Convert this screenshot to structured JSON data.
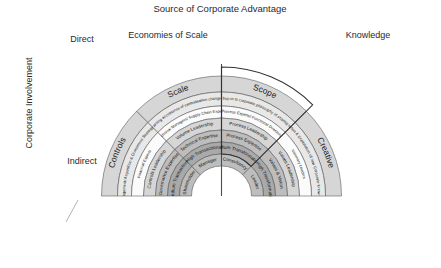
{
  "header": {
    "title": "Source of Corporate Advantage",
    "left_group": "Economies of Scale",
    "right_group": "Knowledge"
  },
  "vertical_axis": {
    "label": "Corporate Involvement",
    "top": "Direct",
    "bottom": "Indirect"
  },
  "chart_data": {
    "type": "diagram",
    "title": "Source of Corporate Advantage",
    "subtype": "concentric-arc-segments",
    "rings_outer_to_inner": [
      "configuration",
      "key_challenge",
      "people_type",
      "leadership_basis",
      "leadership_focus",
      "leadership_role",
      "centre_style"
    ],
    "sectors": [
      {
        "name": "Controls",
        "group": "Economies of Scale",
        "key_challenge": "Portfolio Management/ Acquisition & Divestment Strategy to Add Value",
        "people_type": "Financial Experts",
        "leadership_basis": "Controls Leadership",
        "leadership_focus": "Governance Expertise",
        "leadership_role": "Medium Transactional",
        "centre_style": "Shareholder"
      },
      {
        "name": "Scale",
        "group": "Economies of Scale",
        "key_challenge": "Gaining acceptance of centralisation changes",
        "people_type": "Technical Managers/ Supply Chain Experts",
        "leadership_basis": "Volume Leadership",
        "leadership_focus": "Technical Expertise",
        "leadership_role": "High Transactional",
        "centre_style": "Manager"
      },
      {
        "name": "Scope",
        "group": "Knowledge",
        "key_challenge": "Achieving buy-in to corporate philosophy of sharing to leverage",
        "people_type": "Process Experts/ Functional Directors",
        "leadership_basis": "Process Leadership",
        "leadership_focus": "Process Expertise",
        "leadership_role": "Medium Transformational",
        "centre_style": "Consultancy"
      },
      {
        "name": "Creative",
        "group": "Knowledge",
        "key_challenge": "Creation & Exploitation of new Corporate Know-How",
        "people_type": "Visionary Leaders",
        "leadership_basis": "Values Leadership",
        "leadership_focus": "Values & Vision",
        "leadership_role": "Very High Transformational",
        "centre_style": "Leader"
      }
    ],
    "footer_labels_left": [
      "Corporate Configuration",
      "Dominant type of People at Corporate Centre",
      "Basis of Leadership",
      "Corporate Centre Style"
    ],
    "footer_labels_right": [
      "Leadership Role & its Importance",
      "Leadership Focus",
      "Key Leadership Challenges"
    ]
  },
  "colors": {
    "ring_dark": "#a9a9a9",
    "ring_mid": "#bdbdbd",
    "ring_light": "#d6d6d6",
    "ring_pale": "#e8e8e8",
    "ring_white": "#fbfbfb",
    "outline": "#4d4d4d",
    "text": "#1a1a1a"
  }
}
